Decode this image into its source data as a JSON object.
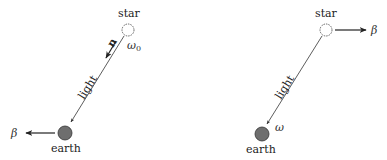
{
  "left_panel": {
    "star_label": "star",
    "earth_label": "earth",
    "light_label": "light",
    "omega_label": "ω",
    "omega_sub": "0",
    "n_label": "n",
    "beta_label": "β"
  },
  "right_panel": {
    "star_label": "star",
    "earth_label": "earth",
    "light_label": "light",
    "omega_label": "ω",
    "beta_label": "β"
  },
  "colors": {
    "earth_fill": "#6e6e6e",
    "line": "#333333"
  }
}
